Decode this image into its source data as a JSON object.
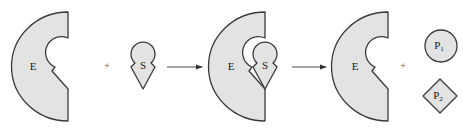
{
  "diagram": {
    "colors": {
      "fill": "#e3e3e3",
      "stroke": "#3a3a3a",
      "text": "#1a1a1a"
    },
    "stages": [
      {
        "id": "reactants",
        "items": [
          {
            "label": "E",
            "shape": "enzyme"
          },
          {
            "operator": "+"
          },
          {
            "label": "S",
            "shape": "substrate"
          }
        ]
      },
      {
        "id": "complex",
        "items": [
          {
            "label": "E",
            "shape": "enzyme"
          },
          {
            "label": "S",
            "shape": "substrate-bound"
          }
        ]
      },
      {
        "id": "products",
        "items": [
          {
            "label": "E",
            "shape": "enzyme"
          },
          {
            "operator": "+"
          },
          {
            "label": "P",
            "subscript": "1",
            "shape": "circle"
          },
          {
            "label": "P",
            "subscript": "2",
            "shape": "diamond"
          }
        ]
      }
    ],
    "arrows": [
      {
        "from": "reactants",
        "to": "complex",
        "direction": "right"
      },
      {
        "from": "complex",
        "to": "products",
        "direction": "right"
      }
    ],
    "labels": {
      "e1": "E",
      "s1": "S",
      "plus1": "+",
      "e2": "E",
      "s2": "S",
      "e3": "E",
      "plus2": "+",
      "p1": "P",
      "p1_sub": "1",
      "p2": "P",
      "p2_sub": "2"
    }
  }
}
